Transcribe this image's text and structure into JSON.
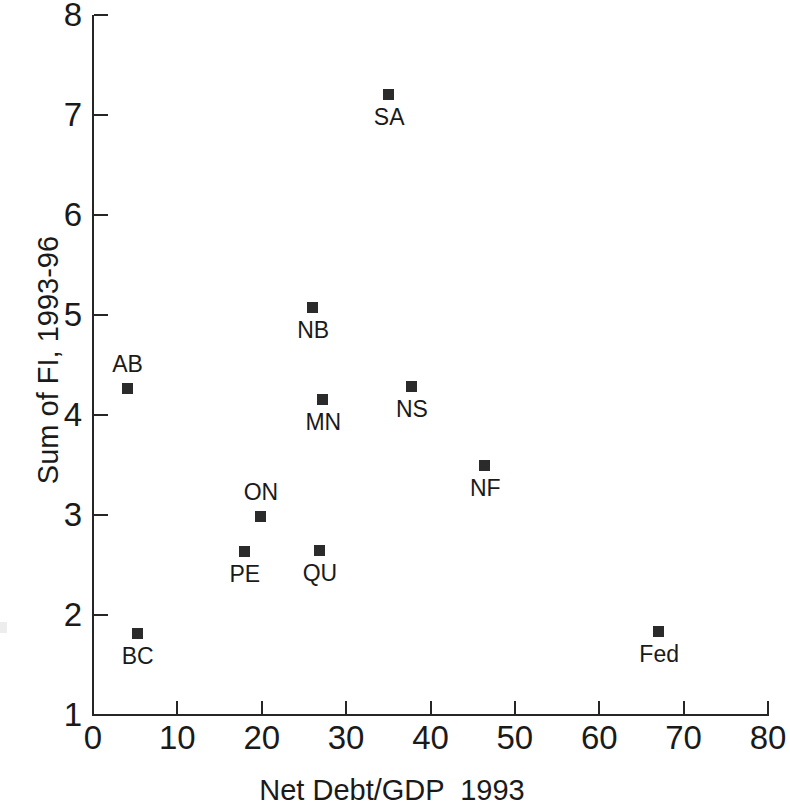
{
  "chart_data": {
    "type": "scatter",
    "title": "",
    "xlabel": "Net Debt/GDP  1993",
    "ylabel": "Sum of FI, 1993-96",
    "xlim": [
      0,
      80
    ],
    "ylim": [
      1,
      8
    ],
    "xticks": [
      0,
      10,
      20,
      30,
      40,
      50,
      60,
      70,
      80
    ],
    "yticks": [
      1,
      2,
      3,
      4,
      5,
      6,
      7,
      8
    ],
    "xtick_labels": [
      "0",
      "10",
      "20",
      "30",
      "40",
      "50",
      "60",
      "70",
      "80"
    ],
    "ytick_labels": [
      "1",
      "2",
      "3",
      "4",
      "5",
      "6",
      "7",
      "8"
    ],
    "grid": false,
    "legend": "none",
    "marker_style": "filled-square",
    "marker_color": "#2b2b2b",
    "axis_color": "#262626",
    "background_color": "#ffffff",
    "points": [
      {
        "label": "SA",
        "x": 35.1,
        "y": 7.2,
        "label_pos": "below"
      },
      {
        "label": "NB",
        "x": 26.1,
        "y": 5.07,
        "label_pos": "below"
      },
      {
        "label": "NS",
        "x": 37.8,
        "y": 4.28,
        "label_pos": "below"
      },
      {
        "label": "AB",
        "x": 4.1,
        "y": 4.26,
        "label_pos": "above"
      },
      {
        "label": "MN",
        "x": 27.3,
        "y": 4.15,
        "label_pos": "below"
      },
      {
        "label": "NF",
        "x": 46.5,
        "y": 3.49,
        "label_pos": "below"
      },
      {
        "label": "ON",
        "x": 19.9,
        "y": 2.98,
        "label_pos": "above"
      },
      {
        "label": "QU",
        "x": 26.9,
        "y": 2.64,
        "label_pos": "below"
      },
      {
        "label": "PE",
        "x": 18.0,
        "y": 2.63,
        "label_pos": "below"
      },
      {
        "label": "Fed",
        "x": 67.1,
        "y": 1.83,
        "label_pos": "below"
      },
      {
        "label": "BC",
        "x": 5.3,
        "y": 1.81,
        "label_pos": "below"
      }
    ]
  }
}
